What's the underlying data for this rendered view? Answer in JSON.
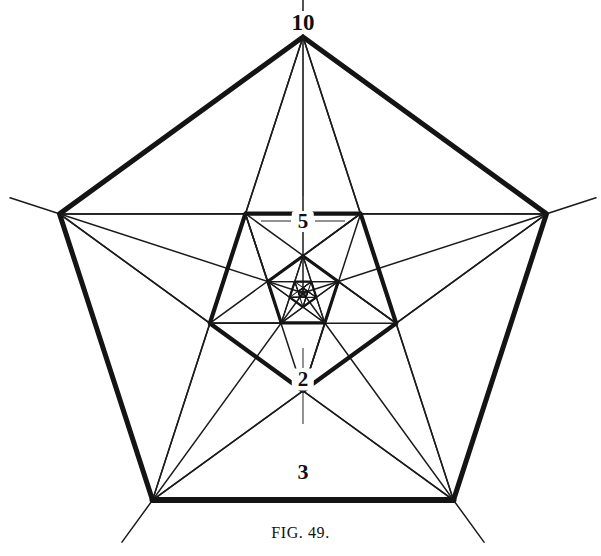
{
  "figure": {
    "caption": "FIG. 49.",
    "caption_lead": "Fig.",
    "caption_number": "49."
  },
  "canvas": {
    "width": 601,
    "height": 556,
    "background": "#ffffff",
    "ink": "#141414"
  },
  "labels": [
    {
      "id": "label-10",
      "text": "10",
      "x": 303,
      "y": 22
    },
    {
      "id": "label-5",
      "text": "5",
      "x": 303,
      "y": 221
    },
    {
      "id": "label-2",
      "text": "2",
      "x": 303,
      "y": 379
    },
    {
      "id": "label-3",
      "text": "3",
      "x": 303,
      "y": 472
    }
  ],
  "chart_data": {
    "type": "line",
    "title": "FIG. 49.",
    "subtitle": "",
    "xlabel": "",
    "ylabel": "",
    "legend_position": "none",
    "grid": false,
    "projection": "polar-pentagonal",
    "axes_count": 5,
    "center": {
      "x": 303,
      "y": 293
    },
    "outer_radius": 256,
    "rotation_deg": -90,
    "scale_ratio": 0.382,
    "ring_count": 5,
    "spoke_overshoot": 52,
    "axis_tick_values": [
      10,
      5,
      3,
      2
    ],
    "categories": [
      "A",
      "B",
      "C",
      "D",
      "E"
    ],
    "series": [
      {
        "name": "Ring 1 (outermost)",
        "radius": 256,
        "values": [
          10,
          10,
          10,
          10,
          10
        ],
        "weight": "thick"
      },
      {
        "name": "Ring 2",
        "radius": 98,
        "values": [
          5,
          5,
          5,
          5,
          5
        ],
        "weight": "thick"
      },
      {
        "name": "Ring 3",
        "radius": 37,
        "values": [
          2,
          2,
          2,
          2,
          2
        ],
        "weight": "thick"
      },
      {
        "name": "Ring 4",
        "radius": 14,
        "values": [
          1,
          1,
          1,
          1,
          1
        ],
        "weight": "thick"
      },
      {
        "name": "Ring 5 (innermost)",
        "radius": 5,
        "values": [
          0.4,
          0.4,
          0.4,
          0.4,
          0.4
        ],
        "weight": "thin"
      }
    ],
    "annotations": [
      {
        "text": "10",
        "radius": 256,
        "axis": "top",
        "note": "outer pentagon apex value"
      },
      {
        "text": "5",
        "radius": 98,
        "axis": "top",
        "note": "second ring value"
      },
      {
        "text": "2",
        "radius": 37,
        "axis": "top",
        "note": "third ring value"
      },
      {
        "text": "3",
        "radius": 180,
        "axis": "bottom",
        "note": "value on lower pentagon edge"
      }
    ],
    "ylim": [
      0,
      10
    ]
  }
}
